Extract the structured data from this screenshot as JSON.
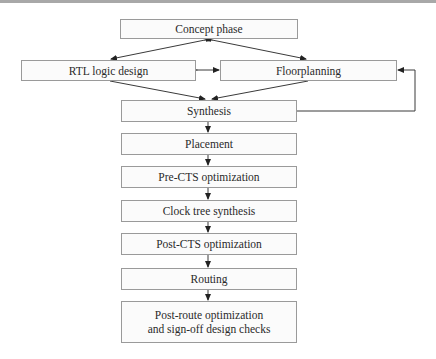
{
  "diagram": {
    "type": "flowchart",
    "title": "",
    "nodes": [
      {
        "id": "concept",
        "label": "Concept phase"
      },
      {
        "id": "rtl",
        "label": "RTL logic design"
      },
      {
        "id": "floorplan",
        "label": "Floorplanning"
      },
      {
        "id": "synthesis",
        "label": "Synthesis"
      },
      {
        "id": "placement",
        "label": "Placement"
      },
      {
        "id": "prects",
        "label": "Pre-CTS optimization"
      },
      {
        "id": "cts",
        "label": "Clock tree synthesis"
      },
      {
        "id": "postcts",
        "label": "Post-CTS optimization"
      },
      {
        "id": "routing",
        "label": "Routing"
      },
      {
        "id": "postroute",
        "label": "Post-route optimization and sign-off design checks",
        "line1": "Post-route optimization",
        "line2": "and sign-off design checks"
      }
    ],
    "edges": [
      {
        "from": "concept",
        "to": "rtl",
        "bidirectional": true
      },
      {
        "from": "concept",
        "to": "floorplan",
        "bidirectional": true
      },
      {
        "from": "rtl",
        "to": "floorplan",
        "bidirectional": true
      },
      {
        "from": "rtl",
        "to": "synthesis"
      },
      {
        "from": "floorplan",
        "to": "synthesis"
      },
      {
        "from": "synthesis",
        "to": "floorplan",
        "note": "feedback loop"
      },
      {
        "from": "synthesis",
        "to": "placement"
      },
      {
        "from": "placement",
        "to": "prects"
      },
      {
        "from": "prects",
        "to": "cts"
      },
      {
        "from": "cts",
        "to": "postcts"
      },
      {
        "from": "postcts",
        "to": "routing"
      },
      {
        "from": "routing",
        "to": "postroute"
      }
    ],
    "colors": {
      "line": "#3a3a3a",
      "box_border": "#9a9a9a",
      "box_fill": "#fbfbfb"
    }
  }
}
